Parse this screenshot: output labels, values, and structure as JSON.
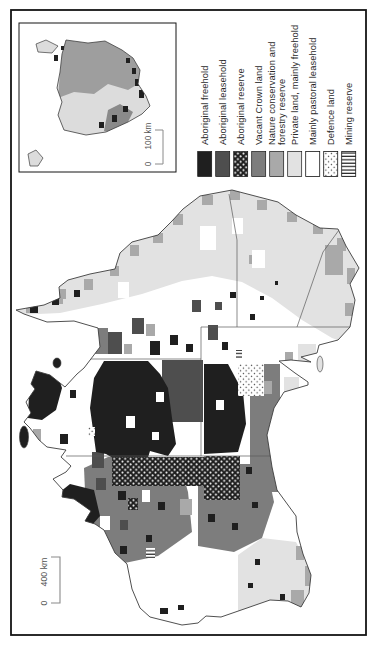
{
  "figure": {
    "kind": "land-tenure-map",
    "orientation": "rotated-90-ccw",
    "regions_shown": [
      "Australia mainland",
      "Tasmania inset"
    ]
  },
  "legend": {
    "items": [
      {
        "label": "Aboriginal freehold",
        "fill": "#1f1f1f",
        "pattern": "solid"
      },
      {
        "label": "Aboriginal leasehold",
        "fill": "#4e4e4e",
        "pattern": "solid"
      },
      {
        "label": "Aboriginal reserve",
        "fill": "#1f1f1f",
        "pattern": "white-dots-on-black"
      },
      {
        "label": "Vacant Crown land",
        "fill": "#7d7d7d",
        "pattern": "solid"
      },
      {
        "label": "Nature conservation and forestry reserve",
        "lines": [
          "Nature conservation and",
          "forestry reserve"
        ],
        "fill": "#a9a9a9",
        "pattern": "solid"
      },
      {
        "label": "Private land, mainly freehold",
        "fill": "#e2e2e2",
        "pattern": "solid"
      },
      {
        "label": "Mainly pastoral leasehold",
        "fill": "#ffffff",
        "pattern": "solid"
      },
      {
        "label": "Defence land",
        "fill": "#ffffff",
        "pattern": "black-dots-on-white"
      },
      {
        "label": "Mining reserve",
        "fill": "#ffffff",
        "pattern": "stripes"
      }
    ]
  },
  "scale_bars": {
    "main": {
      "zero": "0",
      "distance": "400 km"
    },
    "inset": {
      "zero": "0",
      "distance": "100 km"
    }
  },
  "colors": {
    "figure_border": "#141414",
    "coastline": "#3c3c3c",
    "state_border": "#5a5a5a",
    "ocean": "#ffffff",
    "scale_bar": "#8a8a8a"
  }
}
